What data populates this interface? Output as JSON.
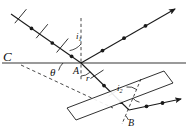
{
  "figure": {
    "type": "optics-ray-diagram",
    "background": "#ffffff",
    "ink": "#1a1a1a",
    "surface_color": "#9a9a9a"
  },
  "labels": {
    "point_c": "C",
    "point_a": "A",
    "point_b": "B",
    "angle_theta": "θ",
    "angle_i1_base": "i",
    "angle_i1_sub": "1",
    "angle_r": "r",
    "angle_i2_base": "i",
    "angle_i2_sub": "2"
  },
  "geometry": {
    "point_a": {
      "x": 81,
      "y": 63
    },
    "point_b": {
      "x": 129,
      "y": 110
    },
    "surface_line": {
      "x1": 2,
      "y1": 63,
      "x2": 186,
      "y2": 63
    },
    "normal_at_a": {
      "x1": 81,
      "y1": 18,
      "x2": 81,
      "y2": 80
    },
    "normal_at_b": {
      "x1": 140,
      "y1": 80,
      "x2": 122,
      "y2": 123
    },
    "incident_ray": {
      "x1": 11,
      "y1": 14,
      "x2": 81,
      "y2": 63
    },
    "reflected_ray": {
      "x1": 81,
      "y1": 63,
      "x2": 177,
      "y2": 8
    },
    "refracted_ray": {
      "x1": 81,
      "y1": 63,
      "x2": 129,
      "y2": 110
    },
    "exit_ray": {
      "x1": 129,
      "y1": 110,
      "x2": 183,
      "y2": 99
    },
    "dashed_construction": {
      "x1": 21,
      "y1": 65,
      "x2": 113,
      "y2": 108
    },
    "slab_angle_deg": 21
  },
  "polarization": {
    "incident_ray_markers": "dots-and-dashes",
    "reflected_ray_markers": "dots-only",
    "refracted_ray_markers": "dots-and-dashes",
    "exit_ray_markers": "dots-only"
  }
}
